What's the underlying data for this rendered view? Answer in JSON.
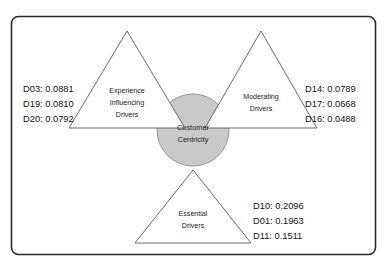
{
  "diagram": {
    "frame": {
      "stroke_color": "#2b2b2b"
    },
    "center": {
      "label_line1": "Customer",
      "label_line2": "Centricity",
      "fill_color": "#c9c9c9",
      "stroke_color": "#8c8c8c"
    },
    "triangles": [
      {
        "id": "experience-influencing-drivers",
        "orientation": "up",
        "label_lines": [
          "Experience",
          "Influencing",
          "Drivers"
        ]
      },
      {
        "id": "moderating-drivers",
        "orientation": "up",
        "label_lines": [
          "Moderating",
          "Drivers"
        ]
      },
      {
        "id": "essential-drivers",
        "orientation": "up",
        "label_lines": [
          "Essential",
          "Drivers"
        ]
      }
    ],
    "score_groups": [
      {
        "id": "experience-influencing-scores",
        "position": "left",
        "items": [
          {
            "code": "D03",
            "value": "0.0881",
            "text": "D03: 0.0881"
          },
          {
            "code": "D19",
            "value": "0.0810",
            "text": "D19: 0.0810"
          },
          {
            "code": "D20",
            "value": "0.0792",
            "text": "D20: 0.0792"
          }
        ]
      },
      {
        "id": "moderating-scores",
        "position": "right",
        "items": [
          {
            "code": "D14",
            "value": "0.0789",
            "text": "D14: 0.0789"
          },
          {
            "code": "D17",
            "value": "0.0668",
            "text": "D17: 0.0668"
          },
          {
            "code": "D16",
            "value": "0.0488",
            "text": "D16: 0.0488"
          }
        ]
      },
      {
        "id": "essential-scores",
        "position": "bottom-right",
        "items": [
          {
            "code": "D10",
            "value": "0.2096",
            "text": "D10: 0.2096"
          },
          {
            "code": "D01",
            "value": "0.1963",
            "text": "D01: 0.1963"
          },
          {
            "code": "D11",
            "value": "0.1511",
            "text": "D11: 0.1511"
          }
        ]
      }
    ]
  }
}
